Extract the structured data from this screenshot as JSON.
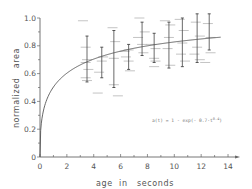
{
  "chart_data": {
    "type": "scatter",
    "title": "",
    "xlabel": "age  in   seconds",
    "ylabel": "normalized   area",
    "xlim": [
      0,
      14.5
    ],
    "ylim": [
      0,
      1.0
    ],
    "x_ticks": [
      "0",
      "2",
      "4",
      "6",
      "8",
      "10",
      "12",
      "14"
    ],
    "y_ticks": [
      "0",
      "0.2",
      "0.4",
      "0.6",
      "0.8",
      "1.0"
    ],
    "grid": false,
    "legend": null,
    "annotation": "a(t) = 1 - exp(- 0.7·t^(0.4))",
    "fit_curve": {
      "name": "a(t) = 1 - exp(-0.7·t^0.4)",
      "a": 0.7,
      "b": 0.4,
      "x_range": [
        0,
        13.5
      ]
    },
    "series": [
      {
        "name": "error bars (mean ± range)",
        "x": [
          3.5,
          4.6,
          5.5,
          6.6,
          7.6,
          8.5,
          9.6,
          10.6,
          11.7,
          12.6
        ],
        "y_low": [
          0.54,
          0.57,
          0.5,
          0.63,
          0.73,
          0.68,
          0.64,
          0.65,
          0.68,
          0.77
        ],
        "y_high": [
          0.87,
          0.79,
          0.91,
          0.81,
          0.97,
          0.89,
          0.97,
          1.0,
          1.03,
          1.03
        ]
      },
      {
        "name": "individual measurements (horizontal ticks)",
        "points": [
          [
            3.2,
            0.98
          ],
          [
            3.4,
            0.79
          ],
          [
            3.5,
            0.7
          ],
          [
            3.4,
            0.68
          ],
          [
            3.6,
            0.63
          ],
          [
            3.4,
            0.57
          ],
          [
            3.5,
            0.55
          ],
          [
            4.4,
            0.61
          ],
          [
            4.7,
            0.72
          ],
          [
            4.6,
            0.69
          ],
          [
            4.3,
            0.46
          ],
          [
            5.4,
            0.93
          ],
          [
            5.6,
            0.83
          ],
          [
            5.5,
            0.71
          ],
          [
            5.5,
            0.52
          ],
          [
            5.8,
            0.44
          ],
          [
            6.3,
            0.76
          ],
          [
            6.6,
            0.77
          ],
          [
            6.4,
            0.72
          ],
          [
            6.6,
            0.69
          ],
          [
            6.7,
            0.62
          ],
          [
            7.4,
            1.0
          ],
          [
            7.3,
            0.86
          ],
          [
            7.8,
            0.9
          ],
          [
            7.6,
            0.81
          ],
          [
            7.7,
            0.75
          ],
          [
            8.3,
            0.81
          ],
          [
            8.6,
            0.78
          ],
          [
            8.5,
            0.71
          ],
          [
            8.6,
            0.69
          ],
          [
            8.5,
            0.65
          ],
          [
            9.3,
            0.98
          ],
          [
            9.7,
            0.95
          ],
          [
            9.6,
            0.86
          ],
          [
            9.5,
            0.78
          ],
          [
            9.7,
            0.66
          ],
          [
            10.4,
            0.99
          ],
          [
            10.7,
            0.91
          ],
          [
            10.6,
            0.82
          ],
          [
            10.5,
            0.74
          ],
          [
            10.8,
            0.69
          ],
          [
            11.6,
            0.97
          ],
          [
            11.9,
            0.87
          ],
          [
            11.7,
            0.79
          ],
          [
            11.5,
            0.74
          ],
          [
            11.9,
            0.7
          ],
          [
            12.5,
            0.96
          ],
          [
            12.7,
            0.86
          ],
          [
            12.7,
            0.75
          ],
          [
            12.3,
            0.68
          ]
        ]
      }
    ]
  }
}
